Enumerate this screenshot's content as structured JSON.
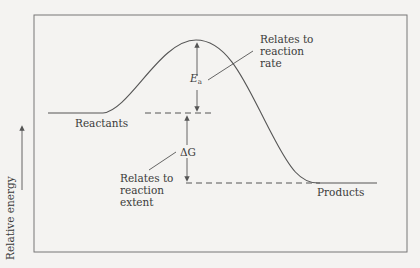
{
  "diagram": {
    "type": "reaction energy profile",
    "y_axis_label": "Relative energy",
    "levels": {
      "reactants": "Reactants",
      "products": "Products"
    },
    "annotations": {
      "ea_symbol": "E",
      "ea_subscript": "a",
      "ea_note_line1": "Relates to",
      "ea_note_line2": "reaction",
      "ea_note_line3": "rate",
      "dg_symbol": "ΔG",
      "dg_note_line1": "Relates to",
      "dg_note_line2": "reaction",
      "dg_note_line3": "extent"
    },
    "colors": {
      "line": "#555555",
      "background": "#f4f3f1",
      "text": "#3a3a3a"
    }
  }
}
